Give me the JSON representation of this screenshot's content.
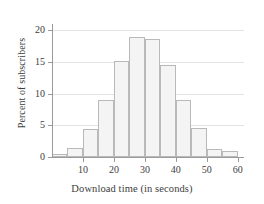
{
  "chart_data": {
    "type": "bar",
    "title": "",
    "subtitle": "",
    "xlabel": "Download time (in seconds)",
    "ylabel": "Percent of subscribers",
    "categories": [
      "0-5",
      "5-10",
      "10-15",
      "15-20",
      "20-25",
      "25-30",
      "30-35",
      "35-40",
      "40-45",
      "45-50",
      "50-55",
      "55-60"
    ],
    "bin_edges": [
      0,
      5,
      10,
      15,
      20,
      25,
      30,
      35,
      40,
      45,
      50,
      55,
      60
    ],
    "bin_width": 5,
    "values": [
      0.5,
      1.5,
      4.5,
      9.0,
      15.1,
      19.0,
      18.6,
      14.6,
      9.0,
      4.6,
      1.3,
      1.0
    ],
    "xlim": [
      0,
      62
    ],
    "ylim": [
      0,
      21
    ],
    "xticks": [
      10,
      20,
      30,
      40,
      50,
      60
    ],
    "yticks": [
      0,
      5,
      10,
      15,
      20
    ],
    "xtick_labels": [
      "10",
      "20",
      "30",
      "40",
      "50",
      "60"
    ],
    "ytick_labels": [
      "0",
      "5",
      "10",
      "15",
      "20"
    ],
    "grid": "horizontal",
    "legend": "none",
    "colors": {
      "bar_fill": "#f4f4f4",
      "bar_border": "#b9b9b9",
      "axis": "#9a9a9a",
      "gridline": "#e2e2e2",
      "text": "#3d3d3d",
      "background": "#ffffff"
    }
  }
}
